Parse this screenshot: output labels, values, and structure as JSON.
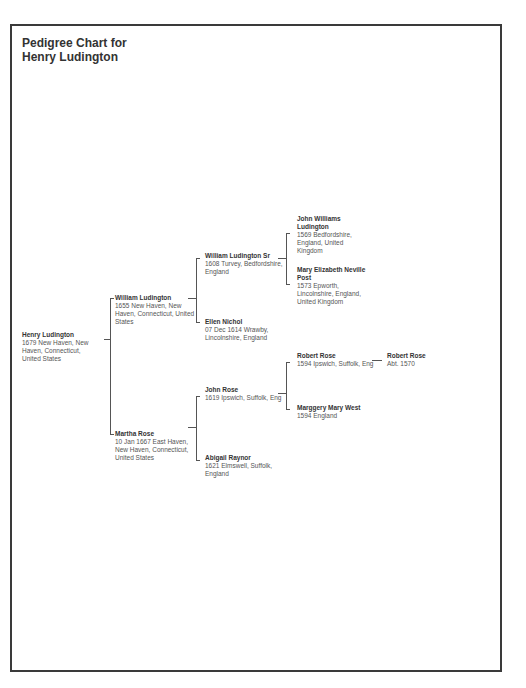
{
  "title": {
    "line1": "Pedigree Chart for",
    "line2": "Henry Ludington"
  },
  "people": {
    "p1": {
      "name": "Henry Ludington",
      "detail": "1679 New Haven, New Haven, Connecticut, United States"
    },
    "p2": {
      "name": "William Ludington",
      "detail": "1655 New Haven, New Haven, Connecticut, United States"
    },
    "p3": {
      "name": "Martha Rose",
      "detail": "10 Jan 1667 East Haven, New Haven, Connecticut, United States"
    },
    "p4": {
      "name": "William Ludington Sr",
      "detail": "1608 Turvey, Bedfordshire, England"
    },
    "p5": {
      "name": "Ellen Nichol",
      "detail": "07 Dec 1614 Wrawby, Lincolnshire, England"
    },
    "p6": {
      "name": "John Rose",
      "detail": "1619 Ipswich, Suffolk, Eng"
    },
    "p7": {
      "name": "Abigail Raynor",
      "detail": "1621 Elmswell, Suffolk, England"
    },
    "p8": {
      "name": "John Williams Ludington",
      "detail": "1569 Bedfordshire, England, United Kingdom"
    },
    "p9": {
      "name": "Mary Elizabeth Neville Post",
      "detail": "1573 Epworth, Lincolnshire, England, United Kingdom"
    },
    "p12": {
      "name": "Robert Rose",
      "detail": "1594 Ipswich, Suffolk, Eng"
    },
    "p13": {
      "name": "Marggery Mary West",
      "detail": "1594 England"
    },
    "p24": {
      "name": "Robert Rose",
      "detail": "Abt. 1570"
    }
  }
}
